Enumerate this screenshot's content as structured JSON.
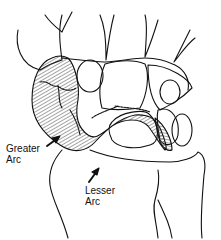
{
  "diagram": {
    "labels": {
      "greater_arc": [
        "Greater",
        "Arc"
      ],
      "lesser_arc": [
        "Lesser",
        "Arc"
      ]
    },
    "colors": {
      "line": "#111111",
      "background": "#ffffff",
      "hatch": "#333333"
    }
  }
}
